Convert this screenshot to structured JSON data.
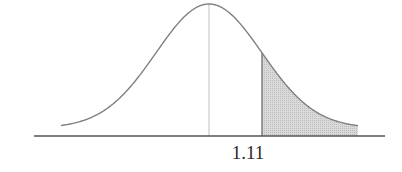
{
  "chart_data": {
    "type": "area",
    "title": "",
    "distribution": "normal",
    "mean": 0,
    "std": 1,
    "marked_value": 1.11,
    "shaded_region": {
      "from": 1.11,
      "to": "right tail",
      "side": "right"
    },
    "xlabel": "",
    "ylabel": "",
    "tick_labels": [
      "1.11"
    ],
    "center_line": {
      "x": 0,
      "style": "dotted",
      "color": "#bbbbbb"
    },
    "grid": false,
    "legend": null
  },
  "labels": {
    "marked_value": "1.11"
  },
  "colors": {
    "curve": "#808080",
    "axis": "#555555",
    "shade_fill": "#d4d4d4",
    "shade_edge": "#666666",
    "center_line": "#c0c0c0",
    "text": "#2a2a2a"
  },
  "geometry": {
    "axis_y": 136,
    "axis_x0": 34,
    "axis_x1": 385,
    "mean_px": 209,
    "sigma_px": 53,
    "curve_base_y": 128,
    "curve_amplitude": 124,
    "curve_x0": 61,
    "curve_x1": 358,
    "shade_x0": 262,
    "label_x": 248,
    "label_y": 143
  }
}
